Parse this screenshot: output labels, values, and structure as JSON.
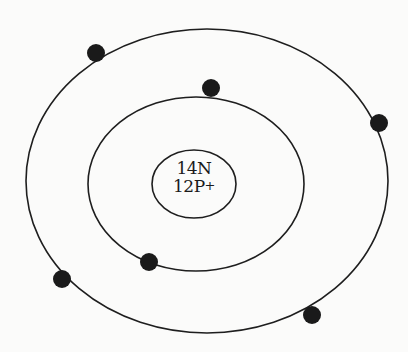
{
  "diagram": {
    "type": "bohr-atom-model",
    "colors": {
      "background": "#fbfbfa",
      "stroke": "#1e1e1e",
      "electron": "#1a1a1a"
    },
    "nucleus": {
      "neutrons_label": "14N",
      "protons_label": "12P",
      "protons_charge": "+",
      "ellipse": {
        "cx": 194,
        "cy": 184,
        "rx": 42,
        "ry": 34
      }
    },
    "shells": [
      {
        "name": "inner-shell",
        "ellipse": {
          "cx": 196,
          "cy": 184,
          "rx": 108,
          "ry": 87
        },
        "electron_count": 2
      },
      {
        "name": "outer-shell",
        "ellipse": {
          "cx": 207,
          "cy": 181,
          "rx": 181,
          "ry": 152
        },
        "electron_count": 4
      }
    ],
    "electrons": [
      {
        "shell": "outer",
        "cx": 96,
        "cy": 53,
        "r": 9
      },
      {
        "shell": "inner",
        "cx": 211,
        "cy": 88,
        "r": 9
      },
      {
        "shell": "outer",
        "cx": 379,
        "cy": 123,
        "r": 9
      },
      {
        "shell": "inner",
        "cx": 149,
        "cy": 262,
        "r": 9
      },
      {
        "shell": "outer",
        "cx": 62,
        "cy": 279,
        "r": 9
      },
      {
        "shell": "outer",
        "cx": 312,
        "cy": 315,
        "r": 9
      }
    ]
  }
}
